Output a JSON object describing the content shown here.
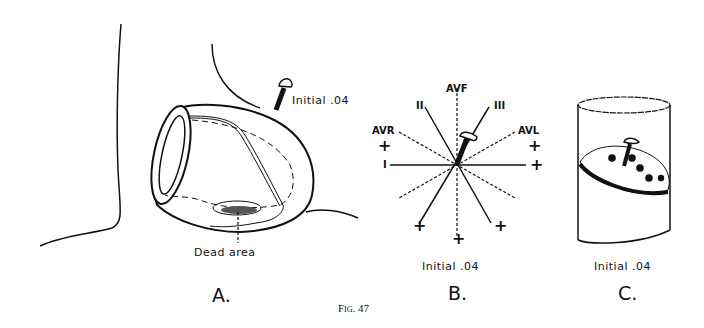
{
  "figure": {
    "caption": "Fig. 47",
    "panels": [
      {
        "id": "A",
        "letter": "A.",
        "labels": {
          "vector": "Initial .04",
          "lesion": "Dead area"
        }
      },
      {
        "id": "B",
        "letter": "B.",
        "labels": {
          "vector": "Initial .04",
          "leads": {
            "avf": "AVF",
            "ii": "II",
            "iii": "III",
            "avr": "AVR",
            "avl": "AVL",
            "i": "I"
          },
          "plus": "+"
        }
      },
      {
        "id": "C",
        "letter": "C.",
        "labels": {
          "vector": "Initial .04"
        }
      }
    ]
  }
}
